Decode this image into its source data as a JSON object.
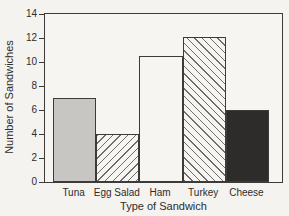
{
  "chart_data": {
    "type": "bar",
    "title": "",
    "categories": [
      "Tuna",
      "Egg Salad",
      "Ham",
      "Turkey",
      "Cheese"
    ],
    "values": [
      7,
      4,
      10.5,
      12.1,
      6
    ],
    "xlabel": "Type of Sandwich",
    "ylabel": "Number of Sandwiches",
    "ylim": [
      0,
      14
    ],
    "yticks": [
      0,
      2,
      4,
      6,
      8,
      10,
      12,
      14
    ],
    "grid": false,
    "legend": "none",
    "bar_styles": [
      {
        "fill": "#c7c6c3",
        "pattern": "solid"
      },
      {
        "fill": "#f6f5f2",
        "pattern": "diagonal-up"
      },
      {
        "fill": "#f6f5f2",
        "pattern": "solid"
      },
      {
        "fill": "#f6f5f2",
        "pattern": "diagonal-down"
      },
      {
        "fill": "#2d2c2a",
        "pattern": "solid"
      }
    ],
    "colors": {
      "axis": "#3c3b39",
      "text": "#2e2d2b",
      "hatch": "#6f6e6c",
      "background": "#f4f3f0"
    }
  }
}
